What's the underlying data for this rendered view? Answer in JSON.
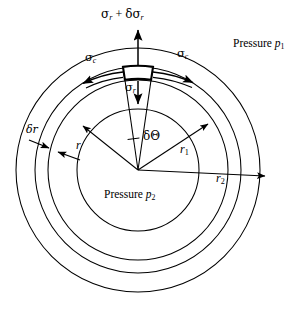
{
  "figure": {
    "kind": "engineering-diagram",
    "background_color": "#ffffff",
    "line_color": "#000000",
    "center": {
      "x": 138,
      "y": 170
    }
  },
  "circles": [
    {
      "name": "inner-bore-circle",
      "radius": 61,
      "label_ref": "r"
    },
    {
      "name": "element-inner-circle",
      "radius": 90,
      "label_ref": "r1"
    },
    {
      "name": "element-outer-circle",
      "radius": 103,
      "label_ref": "r1-outer"
    },
    {
      "name": "outer-surface-circle",
      "radius": 122,
      "label_ref": "r2"
    }
  ],
  "labels": {
    "sigma_r_plus_delta": {
      "sigma": "σ",
      "sub1": "r",
      "plus": " + ",
      "delta": "δσ",
      "sub2": "r"
    },
    "sigma_c_left": {
      "sigma": "σ",
      "sub": "c"
    },
    "sigma_c_right": {
      "sigma": "σ",
      "sub": "c"
    },
    "sigma_r_inner": {
      "sigma": "σ",
      "sub": "r"
    },
    "pressure_outer": {
      "word": "Pressure ",
      "symbol": "p",
      "sub": "1"
    },
    "pressure_inner": {
      "word": "Pressure ",
      "symbol": "p",
      "sub": "2"
    },
    "delta_r": {
      "text": "δr"
    },
    "delta_theta": {
      "text": "δΘ"
    },
    "radius_r": {
      "text": "r"
    },
    "radius_r1": {
      "symbol": "r",
      "sub": "1"
    },
    "radius_r2": {
      "symbol": "r",
      "sub": "2"
    }
  },
  "annotations": {
    "element_arc_span_deg": 16,
    "arrows": [
      {
        "name": "radial-stress-outward-arrow",
        "direction": "up",
        "label": "sigma_r_plus_delta"
      },
      {
        "name": "radial-stress-inward-arrow",
        "direction": "down",
        "label": "sigma_r_inner"
      },
      {
        "name": "hoop-stress-left-arrow",
        "direction": "counterclockwise",
        "label": "sigma_c_left"
      },
      {
        "name": "hoop-stress-right-arrow",
        "direction": "clockwise",
        "label": "sigma_c_right"
      },
      {
        "name": "radius-r-arrow",
        "direction": "upper-left",
        "label": "radius_r"
      },
      {
        "name": "radius-r1-arrow",
        "direction": "upper-right",
        "label": "radius_r1"
      },
      {
        "name": "radius-r2-arrow",
        "direction": "right",
        "label": "radius_r2"
      },
      {
        "name": "delta-r-upper-arrow",
        "direction": "down-right",
        "label": "delta_r"
      },
      {
        "name": "delta-r-lower-arrow",
        "direction": "up-left",
        "label": "delta_r"
      }
    ]
  }
}
